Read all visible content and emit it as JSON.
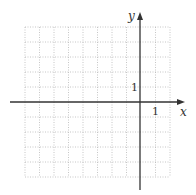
{
  "diagram": {
    "type": "coordinate-grid",
    "x_axis_label": "x",
    "y_axis_label": "y",
    "x_tick_label": "1",
    "y_tick_label": "1",
    "grid": {
      "x_range": [
        -8,
        2
      ],
      "y_range": [
        -5,
        5
      ],
      "line_style": "dotted",
      "line_color": "#bdbdbd"
    },
    "axis_color": "#333333"
  }
}
